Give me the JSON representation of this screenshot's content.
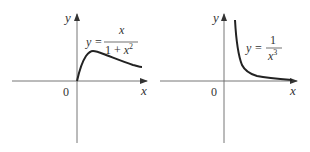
{
  "graphs": [
    {
      "id": "left",
      "axis_x_label": "x",
      "axis_y_label": "y",
      "origin_label": "0",
      "equation_lhs": "y =",
      "equation_numerator": "x",
      "equation_denominator": "1 + x",
      "equation_denominator_exp": "2",
      "function": "y = x / (1 + x^2)"
    },
    {
      "id": "right",
      "axis_x_label": "x",
      "axis_y_label": "y",
      "origin_label": "0",
      "equation_lhs": "y =",
      "equation_numerator": "1",
      "equation_denominator": "x",
      "equation_denominator_exp": "3",
      "function": "y = 1 / x^3"
    }
  ],
  "colors": {
    "axis": "#555555",
    "curve": "#222222",
    "text": "#333333"
  }
}
